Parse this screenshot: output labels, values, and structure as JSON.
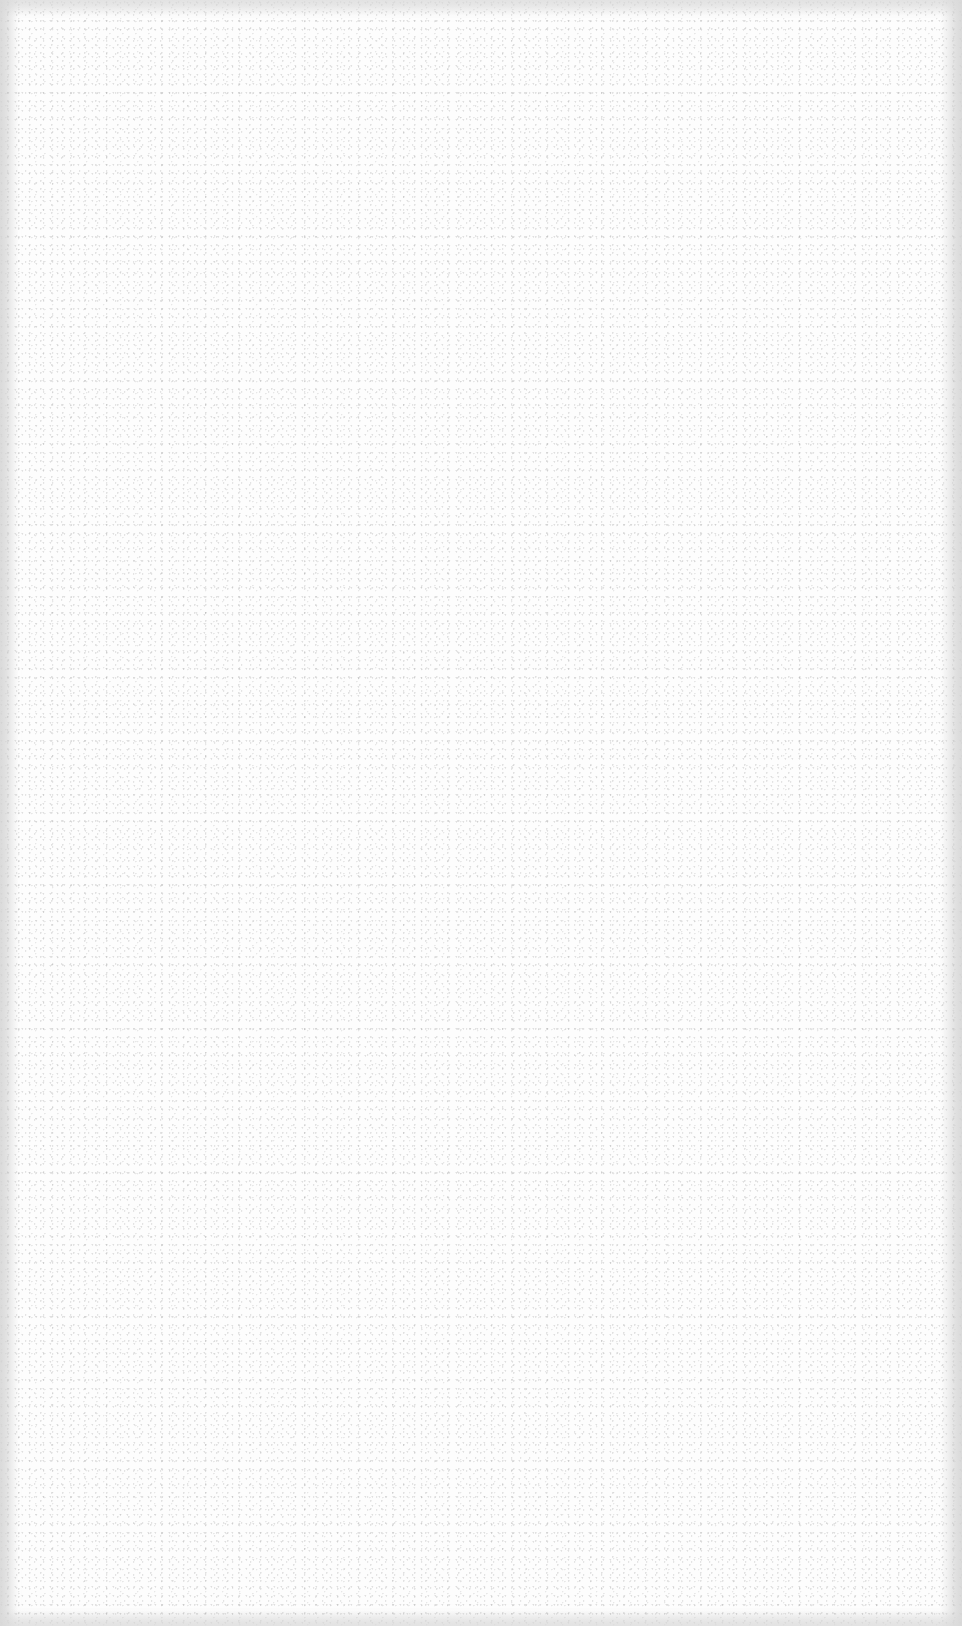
{
  "page": {
    "kind": "blank paper texture",
    "background_color": "#fdfdfd",
    "speckle_color": "#9a9a9a",
    "edge_shade_color": "#d7d7d7"
  }
}
